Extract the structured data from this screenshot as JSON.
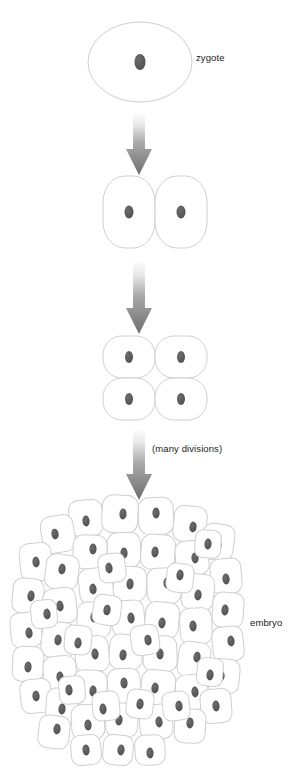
{
  "diagram": {
    "background_color": "#ffffff",
    "cell_fill": "#ffffff",
    "cell_outline_color": "#cfcfcf",
    "nucleus_color": "#585858",
    "arrow_color_top": "#f2f2f2",
    "arrow_color_bottom": "#6e6e6e",
    "text_color": "#1a1a1a"
  },
  "labels": {
    "zygote": "zygote",
    "many_divisions": "(many divisions)",
    "embryo": "embryo"
  },
  "stages": [
    {
      "name": "zygote",
      "cell_count": 1,
      "shape": "ellipse",
      "label": "zygote",
      "center_x": 140,
      "center_y": 62,
      "width": 104,
      "height": 80
    },
    {
      "name": "two-cell",
      "cell_count": 2,
      "shape": "rounded-cells",
      "label": "",
      "center_x": 155,
      "center_y": 212,
      "width": 104,
      "height": 72
    },
    {
      "name": "four-cell",
      "cell_count": 4,
      "shape": "rounded-cells",
      "label": "",
      "center_x": 155,
      "center_y": 378,
      "width": 104,
      "height": 84
    },
    {
      "name": "embryo",
      "cell_count": 61,
      "shape": "cell-mass",
      "label": "embryo",
      "center_x": 131,
      "center_y": 632,
      "width": 228,
      "height": 266
    }
  ],
  "arrows": [
    {
      "name": "arrow-zygote-to-two-cell",
      "x": 139,
      "y_top": 114,
      "y_bottom": 175,
      "width": 26
    },
    {
      "name": "arrow-two-to-four-cell",
      "x": 139,
      "y_top": 262,
      "y_bottom": 334,
      "width": 26
    },
    {
      "name": "arrow-four-cell-to-embryo",
      "x": 139,
      "y_top": 430,
      "y_bottom": 500,
      "width": 26,
      "annotation": "(many divisions)"
    }
  ],
  "embryo_cells": [
    {
      "cx": 86,
      "cy": 518,
      "w": 34,
      "h": 36,
      "rot": -4,
      "nx": 0,
      "ny": 1
    },
    {
      "cx": 120,
      "cy": 514,
      "w": 36,
      "h": 38,
      "rot": 3,
      "nx": 1,
      "ny": 0
    },
    {
      "cx": 156,
      "cy": 516,
      "w": 35,
      "h": 37,
      "rot": -2,
      "nx": 0,
      "ny": -1
    },
    {
      "cx": 190,
      "cy": 524,
      "w": 33,
      "h": 36,
      "rot": 6,
      "nx": 1,
      "ny": 1
    },
    {
      "cx": 58,
      "cy": 534,
      "w": 33,
      "h": 37,
      "rot": -9,
      "nx": -1,
      "ny": 0
    },
    {
      "cx": 218,
      "cy": 542,
      "w": 32,
      "h": 36,
      "rot": 8,
      "nx": 0,
      "ny": 1
    },
    {
      "cx": 36,
      "cy": 562,
      "w": 32,
      "h": 38,
      "rot": -6,
      "nx": 0,
      "ny": 0
    },
    {
      "cx": 90,
      "cy": 552,
      "w": 34,
      "h": 34,
      "rot": 2,
      "nx": 1,
      "ny": -1
    },
    {
      "cx": 124,
      "cy": 550,
      "w": 33,
      "h": 35,
      "rot": -3,
      "nx": 0,
      "ny": 1
    },
    {
      "cx": 158,
      "cy": 552,
      "w": 34,
      "h": 35,
      "rot": 4,
      "nx": -1,
      "ny": 0
    },
    {
      "cx": 192,
      "cy": 558,
      "w": 33,
      "h": 35,
      "rot": -5,
      "nx": 1,
      "ny": 0
    },
    {
      "cx": 62,
      "cy": 572,
      "w": 33,
      "h": 35,
      "rot": 7,
      "nx": 0,
      "ny": -1
    },
    {
      "cx": 226,
      "cy": 576,
      "w": 31,
      "h": 35,
      "rot": -4,
      "nx": 0,
      "ny": 1
    },
    {
      "cx": 28,
      "cy": 596,
      "w": 31,
      "h": 35,
      "rot": 5,
      "nx": 1,
      "ny": 0
    },
    {
      "cx": 96,
      "cy": 586,
      "w": 34,
      "h": 36,
      "rot": -6,
      "nx": -1,
      "ny": 1
    },
    {
      "cx": 130,
      "cy": 584,
      "w": 33,
      "h": 35,
      "rot": 3,
      "nx": 0,
      "ny": 0
    },
    {
      "cx": 164,
      "cy": 586,
      "w": 34,
      "h": 36,
      "rot": -2,
      "nx": 1,
      "ny": -1
    },
    {
      "cx": 198,
      "cy": 592,
      "w": 32,
      "h": 36,
      "rot": 6,
      "nx": 0,
      "ny": 1
    },
    {
      "cx": 60,
      "cy": 606,
      "w": 33,
      "h": 36,
      "rot": -7,
      "nx": 0,
      "ny": 0
    },
    {
      "cx": 228,
      "cy": 610,
      "w": 31,
      "h": 35,
      "rot": 4,
      "nx": -1,
      "ny": 0
    },
    {
      "cx": 26,
      "cy": 630,
      "w": 31,
      "h": 35,
      "rot": -5,
      "nx": 1,
      "ny": 1
    },
    {
      "cx": 94,
      "cy": 620,
      "w": 34,
      "h": 36,
      "rot": 2,
      "nx": 0,
      "ny": -1
    },
    {
      "cx": 128,
      "cy": 618,
      "w": 33,
      "h": 35,
      "rot": -4,
      "nx": 1,
      "ny": 0
    },
    {
      "cx": 162,
      "cy": 620,
      "w": 34,
      "h": 36,
      "rot": 5,
      "nx": 0,
      "ny": 1
    },
    {
      "cx": 196,
      "cy": 626,
      "w": 32,
      "h": 36,
      "rot": -3,
      "nx": -1,
      "ny": 0
    },
    {
      "cx": 58,
      "cy": 640,
      "w": 33,
      "h": 36,
      "rot": 6,
      "nx": 0,
      "ny": 0
    },
    {
      "cx": 228,
      "cy": 644,
      "w": 31,
      "h": 35,
      "rot": -6,
      "nx": 1,
      "ny": -1
    },
    {
      "cx": 28,
      "cy": 664,
      "w": 31,
      "h": 35,
      "rot": 3,
      "nx": 0,
      "ny": 1
    },
    {
      "cx": 92,
      "cy": 654,
      "w": 34,
      "h": 36,
      "rot": -5,
      "nx": 1,
      "ny": 0
    },
    {
      "cx": 126,
      "cy": 652,
      "w": 33,
      "h": 35,
      "rot": 4,
      "nx": -1,
      "ny": 1
    },
    {
      "cx": 160,
      "cy": 654,
      "w": 34,
      "h": 36,
      "rot": -2,
      "nx": 0,
      "ny": 0
    },
    {
      "cx": 194,
      "cy": 660,
      "w": 32,
      "h": 36,
      "rot": 7,
      "nx": 1,
      "ny": -1
    },
    {
      "cx": 60,
      "cy": 674,
      "w": 33,
      "h": 36,
      "rot": -4,
      "nx": 0,
      "ny": 1
    },
    {
      "cx": 224,
      "cy": 676,
      "w": 31,
      "h": 34,
      "rot": 5,
      "nx": -1,
      "ny": 0
    },
    {
      "cx": 36,
      "cy": 696,
      "w": 31,
      "h": 34,
      "rot": -6,
      "nx": 0,
      "ny": 0
    },
    {
      "cx": 90,
      "cy": 688,
      "w": 34,
      "h": 36,
      "rot": 3,
      "nx": 1,
      "ny": 1
    },
    {
      "cx": 124,
      "cy": 686,
      "w": 33,
      "h": 35,
      "rot": -3,
      "nx": 0,
      "ny": -1
    },
    {
      "cx": 158,
      "cy": 688,
      "w": 34,
      "h": 36,
      "rot": 6,
      "nx": -1,
      "ny": 0
    },
    {
      "cx": 192,
      "cy": 692,
      "w": 32,
      "h": 35,
      "rot": -5,
      "nx": 1,
      "ny": 0
    },
    {
      "cx": 62,
      "cy": 706,
      "w": 32,
      "h": 35,
      "rot": 4,
      "nx": 0,
      "ny": 1
    },
    {
      "cx": 216,
      "cy": 706,
      "w": 31,
      "h": 34,
      "rot": -4,
      "nx": 0,
      "ny": 0
    },
    {
      "cx": 54,
      "cy": 732,
      "w": 31,
      "h": 33,
      "rot": 6,
      "nx": 1,
      "ny": -1
    },
    {
      "cx": 88,
      "cy": 722,
      "w": 33,
      "h": 35,
      "rot": -3,
      "nx": 0,
      "ny": 1
    },
    {
      "cx": 122,
      "cy": 720,
      "w": 32,
      "h": 34,
      "rot": 4,
      "nx": -1,
      "ny": 0
    },
    {
      "cx": 156,
      "cy": 722,
      "w": 33,
      "h": 35,
      "rot": -5,
      "nx": 1,
      "ny": 0
    },
    {
      "cx": 190,
      "cy": 726,
      "w": 31,
      "h": 34,
      "rot": 3,
      "nx": 0,
      "ny": -1
    },
    {
      "cx": 86,
      "cy": 750,
      "w": 30,
      "h": 30,
      "rot": -4,
      "nx": 0,
      "ny": 0
    },
    {
      "cx": 118,
      "cy": 750,
      "w": 30,
      "h": 30,
      "rot": 5,
      "nx": 1,
      "ny": 0
    },
    {
      "cx": 150,
      "cy": 750,
      "w": 30,
      "h": 30,
      "rot": -3,
      "nx": 0,
      "ny": 1
    },
    {
      "cx": 107,
      "cy": 610,
      "w": 28,
      "h": 30,
      "rot": 8,
      "nx": 0,
      "ny": 0
    },
    {
      "cx": 145,
      "cy": 640,
      "w": 28,
      "h": 30,
      "rot": -8,
      "nx": 1,
      "ny": 0
    },
    {
      "cx": 180,
      "cy": 578,
      "w": 27,
      "h": 29,
      "rot": 6,
      "nx": 0,
      "ny": -1
    },
    {
      "cx": 112,
      "cy": 568,
      "w": 27,
      "h": 29,
      "rot": -7,
      "nx": -1,
      "ny": 0
    },
    {
      "cx": 78,
      "cy": 640,
      "w": 27,
      "h": 29,
      "rot": 5,
      "nx": 0,
      "ny": 1
    },
    {
      "cx": 176,
      "cy": 706,
      "w": 27,
      "h": 29,
      "rot": -6,
      "nx": 1,
      "ny": 0
    },
    {
      "cx": 140,
      "cy": 704,
      "w": 27,
      "h": 29,
      "rot": 7,
      "nx": 0,
      "ny": 0
    },
    {
      "cx": 106,
      "cy": 706,
      "w": 27,
      "h": 29,
      "rot": -5,
      "nx": -1,
      "ny": 1
    },
    {
      "cx": 208,
      "cy": 544,
      "w": 26,
      "h": 28,
      "rot": 4,
      "nx": 0,
      "ny": 0
    },
    {
      "cx": 44,
      "cy": 614,
      "w": 26,
      "h": 28,
      "rot": -6,
      "nx": 1,
      "ny": 0
    },
    {
      "cx": 210,
      "cy": 672,
      "w": 26,
      "h": 28,
      "rot": 5,
      "nx": 0,
      "ny": 1
    },
    {
      "cx": 72,
      "cy": 690,
      "w": 26,
      "h": 28,
      "rot": -4,
      "nx": -1,
      "ny": 0
    }
  ]
}
